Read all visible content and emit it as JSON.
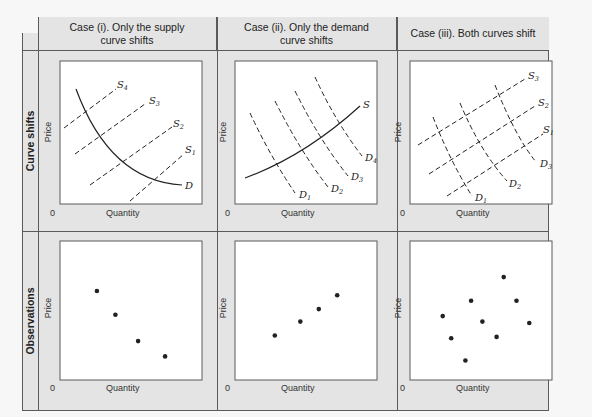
{
  "headers": {
    "case1": "Case (i). Only the supply curve shifts",
    "case1_line1": "Case (i). Only the supply",
    "case1_line2": "curve shifts",
    "case2_line1": "Case (ii). Only the demand",
    "case2_line2": "curve shifts",
    "case3": "Case (iii). Both curves shift"
  },
  "rows": {
    "row1": "Curve shifts",
    "row2": "Observations"
  },
  "axes": {
    "x": "Quantity",
    "y": "Price",
    "origin": "0"
  },
  "colors": {
    "frame_bg": "#e4e4e4",
    "panel_bg": "#ffffff",
    "border": "#5a5a5a",
    "line": "#222222"
  },
  "chart_data": [
    {
      "type": "line",
      "title": "Case (i). Only the supply curve shifts",
      "xlabel": "Quantity",
      "ylabel": "Price",
      "series": [
        {
          "name": "D",
          "style": "solid",
          "shape": "downward convex"
        },
        {
          "name": "S1",
          "style": "dashed",
          "shape": "upward"
        },
        {
          "name": "S2",
          "style": "dashed",
          "shape": "upward"
        },
        {
          "name": "S3",
          "style": "dashed",
          "shape": "upward"
        },
        {
          "name": "S4",
          "style": "dashed",
          "shape": "upward"
        }
      ]
    },
    {
      "type": "line",
      "title": "Case (ii). Only the demand curve shifts",
      "xlabel": "Quantity",
      "ylabel": "Price",
      "series": [
        {
          "name": "S",
          "style": "solid",
          "shape": "upward"
        },
        {
          "name": "D1",
          "style": "dashed",
          "shape": "downward"
        },
        {
          "name": "D2",
          "style": "dashed",
          "shape": "downward"
        },
        {
          "name": "D3",
          "style": "dashed",
          "shape": "downward"
        },
        {
          "name": "D4",
          "style": "dashed",
          "shape": "downward"
        }
      ]
    },
    {
      "type": "line",
      "title": "Case (iii). Both curves shift",
      "xlabel": "Quantity",
      "ylabel": "Price",
      "series": [
        {
          "name": "S1",
          "style": "dashed"
        },
        {
          "name": "S2",
          "style": "dashed"
        },
        {
          "name": "S3",
          "style": "dashed"
        },
        {
          "name": "D1",
          "style": "dashed"
        },
        {
          "name": "D2",
          "style": "dashed"
        },
        {
          "name": "D3",
          "style": "dashed"
        }
      ]
    },
    {
      "type": "scatter",
      "title": "Observations — Case (i)",
      "xlabel": "Quantity",
      "ylabel": "Price",
      "x": [
        0.26,
        0.39,
        0.55,
        0.74
      ],
      "y": [
        0.64,
        0.47,
        0.28,
        0.17
      ],
      "trend": "negative"
    },
    {
      "type": "scatter",
      "title": "Observations — Case (ii)",
      "xlabel": "Quantity",
      "ylabel": "Price",
      "x": [
        0.28,
        0.46,
        0.59,
        0.72
      ],
      "y": [
        0.32,
        0.42,
        0.51,
        0.61
      ],
      "trend": "positive"
    },
    {
      "type": "scatter",
      "title": "Observations — Case (iii)",
      "xlabel": "Quantity",
      "ylabel": "Price",
      "x": [
        0.23,
        0.29,
        0.39,
        0.43,
        0.51,
        0.61,
        0.66,
        0.75,
        0.84
      ],
      "y": [
        0.46,
        0.3,
        0.14,
        0.57,
        0.42,
        0.31,
        0.74,
        0.57,
        0.41
      ],
      "trend": "none"
    }
  ]
}
